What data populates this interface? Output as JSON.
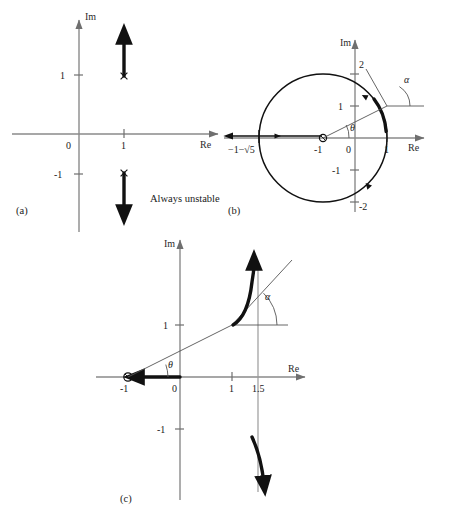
{
  "figure": {
    "panels": [
      {
        "id": "a",
        "caption": "(a)",
        "note": "Always unstable",
        "axes": {
          "real_label": "Re",
          "imag_label": "Im"
        },
        "ticks": {
          "real": [
            "1"
          ],
          "imag": [
            "1",
            "-1"
          ],
          "origin": "0"
        },
        "markers": [
          {
            "name": "pole-upper",
            "glyph": "x",
            "re": 1,
            "im": 1
          },
          {
            "name": "pole-lower",
            "glyph": "x",
            "re": 1,
            "im": -1
          }
        ],
        "branches": [
          {
            "name": "upper-branch",
            "direction": "up",
            "from_im": 1,
            "to_im": 2.2
          },
          {
            "name": "lower-branch",
            "direction": "down",
            "from_im": -1,
            "to_im": -2.2
          }
        ]
      },
      {
        "id": "b",
        "caption": "(b)",
        "axes": {
          "real_label": "Re",
          "imag_label": "Im"
        },
        "ticks": {
          "real": [
            "-1",
            "1"
          ],
          "imag": [
            "1",
            "2",
            "-1",
            "-2"
          ],
          "origin": "0",
          "breakaway": "−1−√5"
        },
        "markers": [
          {
            "name": "zero-at-minus-one",
            "glyph": "o",
            "re": -1,
            "im": 0
          }
        ],
        "angles": [
          {
            "name": "theta",
            "symbol": "θ"
          },
          {
            "name": "alpha",
            "symbol": "α"
          }
        ],
        "locus_shape": "circle centered at -1"
      },
      {
        "id": "c",
        "caption": "(c)",
        "axes": {
          "real_label": "Re",
          "imag_label": "Im"
        },
        "ticks": {
          "real": [
            "1",
            "1.5"
          ],
          "imag": [
            "1",
            "-1"
          ],
          "origin": "0",
          "zero_label": "-1"
        },
        "markers": [
          {
            "name": "zero-at-minus-one",
            "glyph": "o",
            "re": -1,
            "im": 0
          }
        ],
        "angles": [
          {
            "name": "theta",
            "symbol": "θ"
          },
          {
            "name": "alpha",
            "symbol": "α"
          }
        ],
        "asymptote": "1.5"
      }
    ]
  }
}
